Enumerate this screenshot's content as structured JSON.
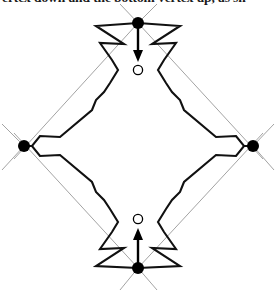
{
  "page": {
    "width": 276,
    "height": 294,
    "background": "#ffffff"
  },
  "caption": {
    "text": "ertex down and the bottom vertex up, as sh",
    "note": "partially clipped line of surrounding body text at top edge"
  },
  "figure": {
    "colors": {
      "outline": "#111111",
      "construction_ray": "#8c8c8c",
      "vertex_fill": "#000000",
      "target_fill": "#ffffff",
      "arrow": "#000000"
    },
    "vertices": [
      {
        "name": "top-vertex",
        "x": 138,
        "y": 23,
        "marker": "filled-dot",
        "radius": 6.0
      },
      {
        "name": "right-vertex",
        "x": 253,
        "y": 146,
        "marker": "filled-dot",
        "radius": 6.0
      },
      {
        "name": "bottom-vertex",
        "x": 138,
        "y": 268,
        "marker": "filled-dot",
        "radius": 6.0
      },
      {
        "name": "left-vertex",
        "x": 24,
        "y": 146,
        "marker": "filled-dot",
        "radius": 6.0
      }
    ],
    "targets": [
      {
        "name": "top-target-circle",
        "x": 138,
        "y": 70,
        "marker": "hollow-circle",
        "radius": 4.6
      },
      {
        "name": "bottom-target-circle",
        "x": 138,
        "y": 219,
        "marker": "hollow-circle",
        "radius": 4.6
      }
    ],
    "arrows": [
      {
        "name": "top-vertex-down-arrow",
        "from_x": 138,
        "from_y": 25,
        "to_x": 138,
        "to_y": 62,
        "direction": "down"
      },
      {
        "name": "bottom-vertex-up-arrow",
        "from_x": 138,
        "from_y": 266,
        "to_x": 138,
        "to_y": 228,
        "direction": "up"
      }
    ],
    "construction_rays": [
      {
        "name": "ray-top-to-lower-left",
        "x1": 138,
        "y1": 23,
        "x2": 14,
        "y2": 159
      },
      {
        "name": "ray-top-to-lower-right",
        "x1": 138,
        "y1": 23,
        "x2": 263,
        "y2": 159
      },
      {
        "name": "ray-top-up-left",
        "x1": 138,
        "y1": 23,
        "x2": 120,
        "y2": 4
      },
      {
        "name": "ray-top-up-right",
        "x1": 138,
        "y1": 23,
        "x2": 157,
        "y2": 4
      },
      {
        "name": "ray-bottom-to-upper-left",
        "x1": 138,
        "y1": 268,
        "x2": 14,
        "y2": 133
      },
      {
        "name": "ray-bottom-to-upper-right",
        "x1": 138,
        "y1": 268,
        "x2": 263,
        "y2": 133
      },
      {
        "name": "ray-bottom-down-left",
        "x1": 138,
        "y1": 268,
        "x2": 120,
        "y2": 290
      },
      {
        "name": "ray-bottom-down-right",
        "x1": 138,
        "y1": 268,
        "x2": 157,
        "y2": 290
      },
      {
        "name": "ray-left-nw",
        "x1": 24,
        "y1": 146,
        "x2": 2,
        "y2": 124
      },
      {
        "name": "ray-left-sw",
        "x1": 24,
        "y1": 146,
        "x2": 2,
        "y2": 170
      },
      {
        "name": "ray-right-ne",
        "x1": 253,
        "y1": 146,
        "x2": 274,
        "y2": 124
      },
      {
        "name": "ray-right-se",
        "x1": 253,
        "y1": 146,
        "x2": 274,
        "y2": 170
      }
    ],
    "outline_paths": [
      {
        "name": "outline-upper-left-lobe",
        "points": "138,23 96,26 124,44 100,43 112,60 118,70 110,83 104,92 96,100 92,110 60,137 40,136 32,146 24,146"
      },
      {
        "name": "outline-upper-right-lobe",
        "points": "138,23 180,26 152,44 176,43 164,60 158,70 166,83 172,92 180,100 184,110 216,137 236,136 244,146 253,146"
      },
      {
        "name": "outline-lower-left-lobe",
        "points": "24,146 32,146 40,156 60,155 92,182 96,192 104,200 110,209 118,222 112,232 100,249 124,248 96,266 138,268"
      },
      {
        "name": "outline-lower-right-lobe",
        "points": "253,146 244,146 236,156 216,155 184,182 180,192 172,200 166,209 158,222 164,232 176,249 152,248 180,266 138,268"
      }
    ]
  }
}
